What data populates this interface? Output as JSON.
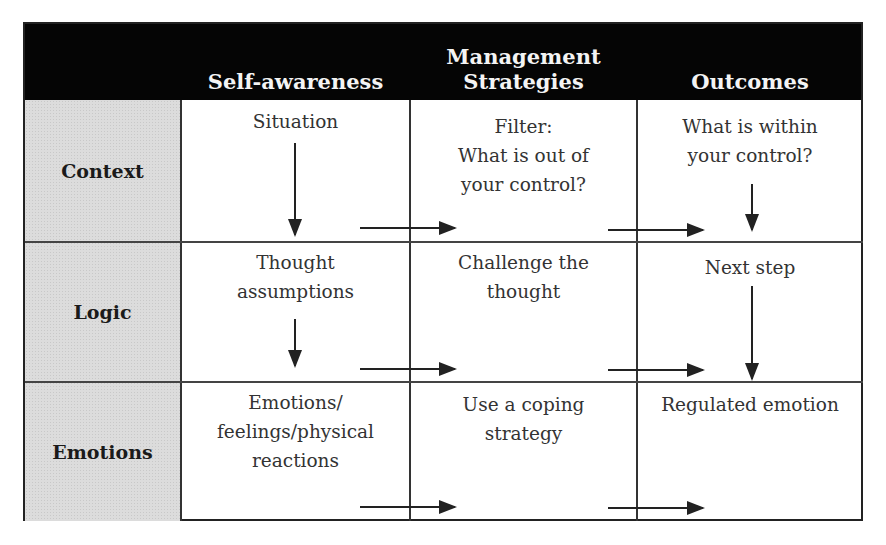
{
  "columns": [
    {
      "label": "Self-awareness"
    },
    {
      "label_line1": "Management",
      "label_line2": "Strategies"
    },
    {
      "label": "Outcomes"
    }
  ],
  "rows": [
    {
      "label": "Context",
      "cells": [
        {
          "lines": [
            "Situation"
          ]
        },
        {
          "lines": [
            "Filter:",
            "What is out of",
            "your control?"
          ]
        },
        {
          "lines": [
            "What is within",
            "your control?"
          ]
        }
      ]
    },
    {
      "label": "Logic",
      "cells": [
        {
          "lines": [
            "Thought",
            "assumptions"
          ]
        },
        {
          "lines": [
            "Challenge the",
            "thought"
          ]
        },
        {
          "lines": [
            "Next step"
          ]
        }
      ]
    },
    {
      "label": "Emotions",
      "cells": [
        {
          "lines": [
            "Emotions/",
            "feelings/physical",
            "reactions"
          ]
        },
        {
          "lines": [
            "Use a coping",
            "strategy"
          ]
        },
        {
          "lines": [
            "Regulated emotion"
          ]
        }
      ]
    }
  ],
  "colors": {
    "header_bg": "#050505",
    "header_text": "#f4f4f4",
    "rowhead_bg": "#dcdcdc",
    "border": "#222222"
  }
}
